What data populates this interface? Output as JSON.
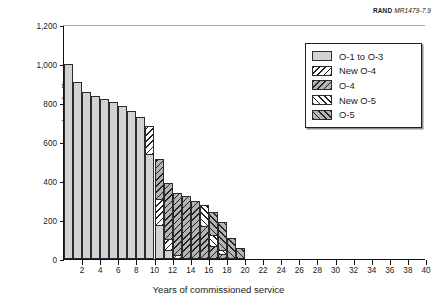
{
  "source": {
    "brand": "RAND",
    "doc_id": "MR1479-7.9"
  },
  "chart_data": {
    "type": "bar",
    "title": "",
    "subtitle": "",
    "xlabel": "Years of commissioned service",
    "ylabel": "Number of officers",
    "stacked": true,
    "grid": false,
    "legend_position": "top-right",
    "xlim": [
      0,
      40
    ],
    "ylim": [
      0,
      1200
    ],
    "ytick_labels": [
      "0",
      "200",
      "400",
      "600",
      "800",
      "1,000",
      "1,200"
    ],
    "ytick_values": [
      0,
      200,
      400,
      600,
      800,
      1000,
      1200
    ],
    "xtick_labels": [
      "2",
      "4",
      "6",
      "8",
      "10",
      "12",
      "14",
      "16",
      "18",
      "20",
      "22",
      "24",
      "26",
      "28",
      "30",
      "32",
      "34",
      "36",
      "38",
      "40"
    ],
    "xtick_values": [
      2,
      4,
      6,
      8,
      10,
      12,
      14,
      16,
      18,
      20,
      22,
      24,
      26,
      28,
      30,
      32,
      34,
      36,
      38,
      40
    ],
    "categories": [
      1,
      2,
      3,
      4,
      5,
      6,
      7,
      8,
      9,
      10,
      11,
      12,
      13,
      14,
      15,
      16,
      17,
      18,
      19,
      20,
      21,
      22,
      23,
      24,
      25,
      26,
      27,
      28,
      29,
      30,
      31,
      32,
      33,
      34,
      35,
      36,
      37,
      38,
      39,
      40
    ],
    "series": [
      {
        "name": "O-1 to O-3",
        "fill": "f-solid",
        "color": "#d2d2d2",
        "values": [
          1000,
          910,
          855,
          835,
          820,
          805,
          785,
          760,
          730,
          540,
          175,
          45,
          0,
          0,
          0,
          0,
          0,
          0,
          0,
          0,
          0,
          0,
          0,
          0,
          0,
          0,
          0,
          0,
          0,
          0,
          0,
          0,
          0,
          0,
          0,
          0,
          0,
          0,
          0,
          0
        ]
      },
      {
        "name": "New O-4",
        "fill": "f-wbs",
        "color": "#ffffff",
        "values": [
          0,
          0,
          0,
          0,
          0,
          0,
          0,
          0,
          0,
          140,
          135,
          60,
          20,
          0,
          0,
          0,
          0,
          0,
          0,
          0,
          0,
          0,
          0,
          0,
          0,
          0,
          0,
          0,
          0,
          0,
          0,
          0,
          0,
          0,
          0,
          0,
          0,
          0,
          0,
          0
        ]
      },
      {
        "name": "O-4",
        "fill": "f-gbs",
        "color": "#b4b4b4",
        "values": [
          0,
          0,
          0,
          0,
          0,
          0,
          0,
          0,
          0,
          0,
          205,
          285,
          320,
          325,
          300,
          170,
          65,
          25,
          0,
          0,
          0,
          0,
          0,
          0,
          0,
          0,
          0,
          0,
          0,
          0,
          0,
          0,
          0,
          0,
          0,
          0,
          0,
          0,
          0,
          0
        ]
      },
      {
        "name": "New O-5",
        "fill": "f-wfs",
        "color": "#ffffff",
        "values": [
          0,
          0,
          0,
          0,
          0,
          0,
          0,
          0,
          0,
          0,
          0,
          0,
          0,
          0,
          0,
          105,
          60,
          20,
          0,
          0,
          0,
          0,
          0,
          0,
          0,
          0,
          0,
          0,
          0,
          0,
          0,
          0,
          0,
          0,
          0,
          0,
          0,
          0,
          0,
          0
        ]
      },
      {
        "name": "O-5",
        "fill": "f-gfs",
        "color": "#b4b4b4",
        "values": [
          0,
          0,
          0,
          0,
          0,
          0,
          0,
          0,
          0,
          0,
          0,
          0,
          0,
          0,
          0,
          0,
          115,
          145,
          110,
          58,
          0,
          0,
          0,
          0,
          0,
          0,
          0,
          0,
          0,
          0,
          0,
          0,
          0,
          0,
          0,
          0,
          0,
          0,
          0,
          0
        ]
      }
    ]
  }
}
